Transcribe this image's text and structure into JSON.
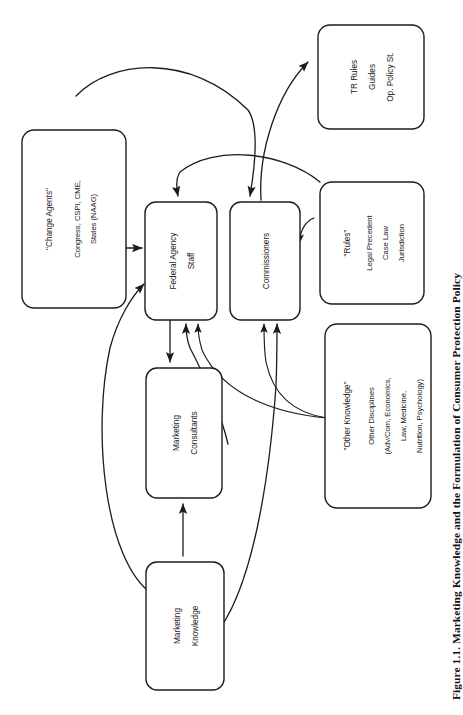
{
  "figure": {
    "caption": "Figure 1.1.  Marketing Knowledge and the Formulation of Consumer Protection Policy",
    "orientation": "rotated-90-ccw",
    "background_color": "#ffffff",
    "line_color": "#1c1c1c"
  },
  "nodes": {
    "change_agents": {
      "id": "change-agents",
      "lines": [
        "\"Change Agents\"",
        "Congress, CSPI, CME,",
        "States (NAAG)"
      ],
      "line1": "\"Change Agents\"",
      "line2": "Congress, CSPI, CME,",
      "line3": "States (NAAG)"
    },
    "federal_agency_staff": {
      "id": "federal-agency-staff",
      "line1": "Federal Agency",
      "line2": "Staff"
    },
    "commissioners": {
      "id": "commissioners",
      "line1": "Commissioners"
    },
    "tr_rules": {
      "id": "tr-rules",
      "line1": "TR Rules",
      "line2": "Guides",
      "line3": "Op. Policy St."
    },
    "rules": {
      "id": "rules",
      "line1": "\"Rules\"",
      "line2": "Legal Precedent",
      "line3": "Case Law",
      "line4": "Jurisdiction"
    },
    "other_knowledge": {
      "id": "other-knowledge",
      "line1": "\"Other Knowledge\"",
      "line2": "Other Disciplines",
      "line3": "(Adv/Com, Economics,",
      "line4": "Law, Medicine,",
      "line5": "Nutrition, Psychology)"
    },
    "marketing_consultants": {
      "id": "marketing-consultants",
      "line1": "Marketing",
      "line2": "Consultants"
    },
    "marketing_knowledge": {
      "id": "marketing-knowledge",
      "line1": "Marketing",
      "line2": "Knowledge"
    }
  },
  "edges": [
    {
      "from": "change_agents",
      "to": "federal_agency_staff",
      "style": "straight-arrow"
    },
    {
      "from": "change_agents",
      "to": "commissioners",
      "style": "curved-arc-over-top"
    },
    {
      "from": "federal_agency_staff",
      "to": "commissioners",
      "style": "short-arrow-right"
    },
    {
      "from": "commissioners",
      "to": "federal_agency_staff",
      "style": "short-arrow-left"
    },
    {
      "from": "commissioners",
      "to": "tr_rules",
      "style": "curved-arrow-up-right"
    },
    {
      "from": "rules",
      "to": "federal_agency_staff",
      "style": "long-curve-left"
    },
    {
      "from": "rules",
      "to": "commissioners",
      "style": "curve-down-left"
    },
    {
      "from": "other_knowledge",
      "to": "federal_agency_staff",
      "style": "fan-curve-up-left"
    },
    {
      "from": "other_knowledge",
      "to": "commissioners",
      "style": "fan-curve-up-left"
    },
    {
      "from": "federal_agency_staff",
      "to": "marketing_consultants",
      "style": "straight-arrow-down"
    },
    {
      "from": "marketing_consultants",
      "to": "federal_agency_staff",
      "style": "curve-arrow-up"
    },
    {
      "from": "marketing_knowledge",
      "to": "marketing_consultants",
      "style": "straight-arrow-up"
    },
    {
      "from": "marketing_knowledge",
      "to": "commissioners",
      "style": "long-curve-up"
    },
    {
      "from": "federal_agency_staff",
      "to": "marketing_knowledge",
      "style": "double-headed-left-arc"
    }
  ]
}
